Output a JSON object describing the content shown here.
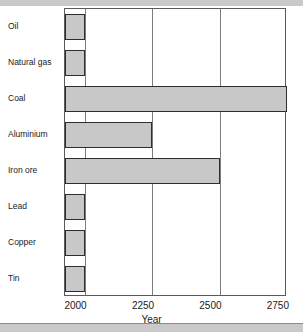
{
  "chart_data": {
    "type": "bar",
    "orientation": "horizontal",
    "title": "",
    "xlabel": "Year",
    "ylabel": "",
    "categories": [
      "Oil",
      "Natural gas",
      "Coal",
      "Aluminium",
      "Iron ore",
      "Lead",
      "Copper",
      "Tin"
    ],
    "values": [
      2000,
      2000,
      2750,
      2250,
      2500,
      2000,
      2000,
      2000
    ],
    "xlim": [
      1927,
      2750
    ],
    "xticks": [
      2000,
      2250,
      2500,
      2750
    ],
    "xtick_labels": [
      "2000",
      "2250",
      "2500",
      "2750"
    ],
    "grid": true,
    "legend": null,
    "bar_fill_color": "#c8c8c8",
    "bar_edge_color": "#2e2e2e",
    "axis_color": "#5a5a5a",
    "gridline_color": "#7d7d7d",
    "background_color": "#ffffff"
  }
}
